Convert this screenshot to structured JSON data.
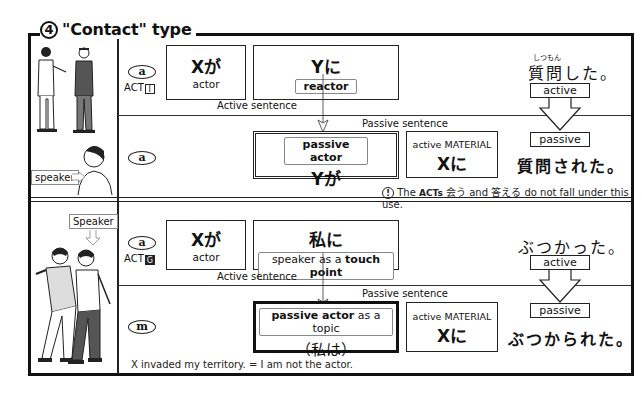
{
  "title": {
    "number": "4",
    "text": "\"Contact\" type"
  },
  "section1": {
    "illustration_top": "two-men-talking",
    "speaker_label": "speaker",
    "active_row": {
      "circle": "a",
      "act_label": "ACT",
      "act_badge": "I",
      "box1": {
        "main": "Xが",
        "sub": "actor"
      },
      "box2": {
        "main": "Yに",
        "sub": "reactor"
      },
      "caption": "Active sentence",
      "furigana": "しつもん",
      "verb": "質問した。",
      "arrow_top": "active"
    },
    "passive_row": {
      "circle": "a",
      "caption": "Passive sentence",
      "box1": {
        "label": "passive actor",
        "main": "Yが"
      },
      "box2": {
        "label": "active MATERIAL",
        "main": "Xに"
      },
      "arrow_bottom": "passive",
      "verb": "質問された。",
      "note_icon": "!",
      "note_pre": "The",
      "note_acts": "ACTs",
      "note_post": "会う and 答える do not fall under this use."
    }
  },
  "section2": {
    "speaker_label": "Speaker",
    "illustration": "two-men-bumping",
    "active_row": {
      "circle": "a",
      "act_label": "ACT",
      "act_badge": "G",
      "box1": {
        "main": "Xが",
        "sub": "actor"
      },
      "box2": {
        "main": "私に",
        "sub_pre": "speaker as a ",
        "sub_bold": "touch point"
      },
      "caption": "Active sentence",
      "verb": "ぶつかった。",
      "arrow_top": "active"
    },
    "passive_row": {
      "circle": "m",
      "caption": "Passive sentence",
      "box1": {
        "label_bold": "passive actor",
        "label_rest": " as a topic",
        "main": "（私は）"
      },
      "box2": {
        "label": "active MATERIAL",
        "main": "Xに"
      },
      "arrow_bottom": "passive",
      "verb": "ぶつかられた。",
      "note": "X invaded my territory. = I am not the actor."
    }
  }
}
